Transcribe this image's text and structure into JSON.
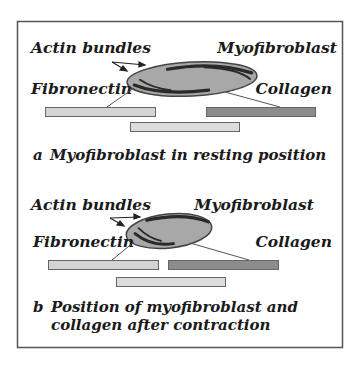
{
  "figure": {
    "panels": [
      {
        "id": "a",
        "state": "resting",
        "labels": {
          "actin": "Actin bundles",
          "myofibroblast": "Myofibroblast",
          "fibronectin": "Fibronectin",
          "collagen": "Collagen"
        },
        "caption_letter": "a",
        "caption_lines": [
          "Myofibroblast in resting position"
        ]
      },
      {
        "id": "b",
        "state": "contracted",
        "labels": {
          "actin": "Actin bundles",
          "myofibroblast": "Myofibroblast",
          "fibronectin": "Fibronectin",
          "collagen": "Collagen"
        },
        "caption_letter": "b",
        "caption_lines": [
          "Position of myofibroblast and",
          "collagen after contraction"
        ]
      }
    ],
    "colors": {
      "frame": "#555555",
      "cell_fill": "#a8a8a8",
      "cell_stroke": "#444444",
      "actin": "#2a2a2a",
      "fiber_light": "#d4d4d4",
      "fiber_dark": "#8c8c8c",
      "fiber_stroke": "#666666",
      "text": "#1a1a1a"
    }
  }
}
